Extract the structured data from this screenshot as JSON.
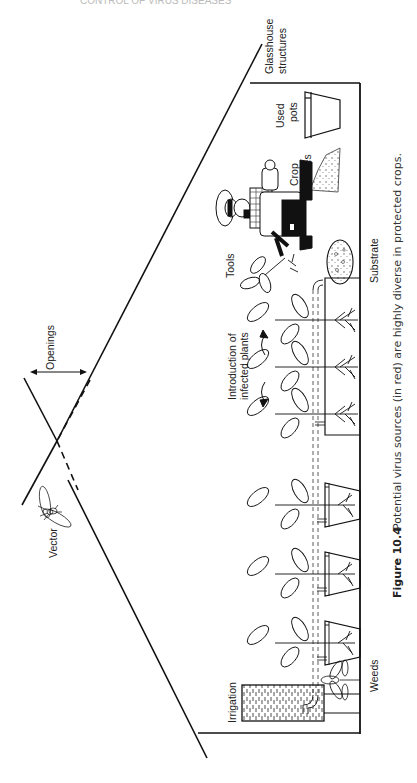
{
  "page": {
    "running_header": "CONTROL OF VIRUS DISEASES",
    "orientation": "rotated 90° (landscape figure on portrait page)"
  },
  "figure": {
    "number": "Figure 10.4",
    "caption": "Potential virus sources (in red) are highly diverse in protected crops.",
    "labels": {
      "glasshouse_line1": "Glasshouse",
      "glasshouse_line2": "structures",
      "used_pots_line1": "Used",
      "used_pots_line2": "pots",
      "crop_residues_line1": "Crop",
      "crop_residues_line2": "residues",
      "tools": "Tools",
      "substrate": "Substrate",
      "openings": "Openings",
      "introduction_line1": "Introduction of",
      "introduction_line2": "infected plants",
      "vector": "Vector",
      "irrigation": "Irrigation",
      "weeds": "Weeds"
    },
    "colors": {
      "line": "#111111",
      "text": "#222222",
      "background": "#ffffff"
    }
  }
}
